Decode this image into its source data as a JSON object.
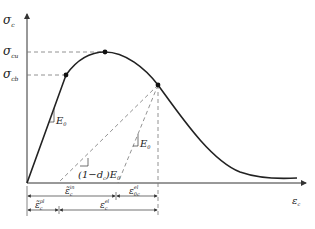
{
  "diagram": {
    "type": "stress-strain curve with unloading paths",
    "axes": {
      "y_label": "σ",
      "y_label_sub": "c",
      "x_label": "ε",
      "x_label_sub": "c"
    },
    "levels": {
      "peak": {
        "label": "σ",
        "sub": "cu"
      },
      "elastic_limit": {
        "label": "σ",
        "sub": "cb"
      }
    },
    "slopes": {
      "initial": {
        "label": "E",
        "sub": "0"
      },
      "unload_elastic": {
        "label": "E",
        "sub": "0"
      },
      "unload_damaged": {
        "label": "(1−d",
        "sub": "c",
        "tail": ")E",
        "tail_sub": "0"
      }
    },
    "dimensions": {
      "row1_left": {
        "label": "ε̃",
        "sub": "c",
        "sup": "in"
      },
      "row1_right": {
        "label": "ε",
        "sub": "0c",
        "sup": "el"
      },
      "row2_left": {
        "label": "ε̃",
        "sub": "c",
        "sup": "pl"
      },
      "row2_right": {
        "label": "ε",
        "sub": "c",
        "sup": "el"
      }
    },
    "colors": {
      "curve": "#222222",
      "dashed": "#777777",
      "axis": "#333333"
    }
  }
}
